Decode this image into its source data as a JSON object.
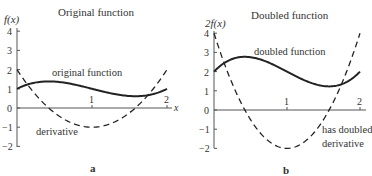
{
  "panels": [
    {
      "id": "a",
      "title": "Original function",
      "ylabel": "f(x)",
      "xlabel": "x",
      "curve_label": "original function",
      "derivative_label": "derivative",
      "caption": "a"
    },
    {
      "id": "b",
      "title": "Doubled function",
      "ylabel": "2f(x)",
      "xlabel": "x",
      "curve_label": "doubled function",
      "derivative_label_line1": "has doubled",
      "derivative_label_line2": "derivative",
      "caption": "b"
    }
  ],
  "chart_data": [
    {
      "type": "line",
      "title": "Original function",
      "xlabel": "x",
      "ylabel": "f(x)",
      "xlim": [
        0,
        2
      ],
      "ylim": [
        -2,
        4
      ],
      "x_ticks": [
        1,
        2
      ],
      "y_ticks": [
        -2,
        -1,
        0,
        1,
        2,
        3,
        4
      ],
      "grid": false,
      "series": [
        {
          "name": "original function",
          "style": "solid",
          "formula": "(x-1)^3 - x + 2",
          "x": [
            0,
            0.25,
            0.5,
            0.75,
            1,
            1.25,
            1.5,
            1.75,
            2
          ],
          "values": [
            1.0,
            1.33,
            1.38,
            1.23,
            1.0,
            0.77,
            0.63,
            0.67,
            1.0
          ]
        },
        {
          "name": "derivative",
          "style": "dashed",
          "formula": "3(x-1)^2 - 1",
          "x": [
            0,
            0.25,
            0.5,
            0.75,
            1,
            1.25,
            1.5,
            1.75,
            2
          ],
          "values": [
            2.0,
            0.69,
            -0.25,
            -0.81,
            -1.0,
            -0.81,
            -0.25,
            0.69,
            2.0
          ]
        }
      ]
    },
    {
      "type": "line",
      "title": "Doubled function",
      "xlabel": "x",
      "ylabel": "2f(x)",
      "xlim": [
        0,
        2
      ],
      "ylim": [
        -2,
        4
      ],
      "x_ticks": [
        1,
        2
      ],
      "y_ticks": [
        -2,
        -1,
        0,
        1,
        2,
        3,
        4
      ],
      "grid": false,
      "series": [
        {
          "name": "doubled function",
          "style": "solid",
          "formula": "2((x-1)^3 - x + 2)",
          "x": [
            0,
            0.25,
            0.5,
            0.75,
            1,
            1.25,
            1.5,
            1.75,
            2
          ],
          "values": [
            2.0,
            2.66,
            2.75,
            2.47,
            2.0,
            1.53,
            1.25,
            1.34,
            2.0
          ]
        },
        {
          "name": "has doubled derivative",
          "style": "dashed",
          "formula": "6(x-1)^2 - 2",
          "x": [
            0,
            0.25,
            0.5,
            0.75,
            1,
            1.25,
            1.5,
            1.75,
            2
          ],
          "values": [
            4.0,
            1.38,
            -0.5,
            -1.63,
            -2.0,
            -1.63,
            -0.5,
            1.38,
            4.0
          ]
        }
      ]
    }
  ]
}
